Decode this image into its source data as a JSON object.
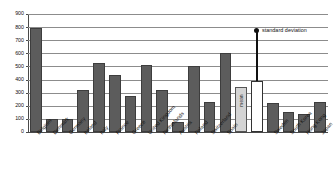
{
  "chart_data": {
    "type": "bar",
    "title": "",
    "subtitle": "",
    "xlabel": "",
    "ylabel": "",
    "ylim": [
      0,
      900
    ],
    "ytick_step": 100,
    "yticks": [
      "0",
      "100",
      "200",
      "300",
      "400",
      "500",
      "600",
      "700",
      "800",
      "900"
    ],
    "grid": true,
    "legend_position": "none",
    "categories": [
      "Belgium",
      "Denmark",
      "Germany",
      "Ireland",
      "Italy",
      "France",
      "Greece",
      "United Kingdom",
      "Netherlands",
      "Austria",
      "Poland",
      "Switzerland",
      "Spain",
      "mean",
      "standard deviation",
      "Sweden",
      "South Korea",
      "Hong Kong",
      "Japan"
    ],
    "values": [
      795,
      100,
      100,
      320,
      525,
      435,
      275,
      510,
      320,
      75,
      500,
      230,
      600,
      345,
      390,
      225,
      150,
      140,
      230
    ],
    "bar_styles": [
      "dark",
      "dark",
      "dark",
      "dark",
      "dark",
      "dark",
      "dark",
      "dark",
      "dark",
      "dark",
      "dark",
      "dark",
      "dark",
      "mean",
      "sd",
      "dark",
      "dark",
      "dark",
      "dark"
    ],
    "annotations": [
      {
        "text": "standard deviation",
        "target_category": "standard deviation"
      }
    ],
    "colors": {
      "bar_dark": "#5c5c5c",
      "bar_mean": "#d4d4d4",
      "bar_sd": "#ffffff",
      "gridline": "#8c8c8c",
      "axis": "#4a4a4a",
      "text": "#111111"
    },
    "inline_labels": [
      {
        "category": "mean",
        "text": "mean",
        "orientation": "vertical"
      }
    ]
  }
}
